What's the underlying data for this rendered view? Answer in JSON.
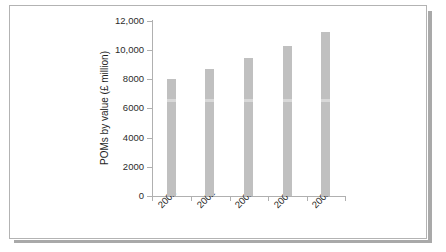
{
  "chart_data": {
    "type": "bar",
    "title": "",
    "subtitle": "",
    "xlabel": "",
    "ylabel": "POMs by value (£ million)",
    "categories": [
      "2001",
      "2002",
      "2003",
      "2004",
      "2005"
    ],
    "values": [
      8000,
      8700,
      9450,
      10300,
      11250
    ],
    "series": [
      {
        "name": "POMs by value",
        "values": [
          8000,
          8700,
          9450,
          10300,
          11250
        ]
      }
    ],
    "ylim": [
      0,
      12000
    ],
    "yticks": [
      0,
      2000,
      4000,
      6000,
      8000,
      10000,
      12000
    ],
    "ytick_labels": [
      "0",
      "2000",
      "4000",
      "6000",
      "8000",
      "10,000",
      "12,000"
    ],
    "xtick_labels": [
      "2001",
      "2002",
      "2003",
      "2004",
      "2005"
    ],
    "xtick_rotation": -45,
    "grid": false,
    "legend": null,
    "legend_position": "none",
    "bar_color": "#c0c0c0",
    "axis_color": "#b0b0b0",
    "text_color": "#2b2b2b",
    "background_color": "#ffffff",
    "annotations": []
  },
  "figure": {
    "card_background": "#ffffff",
    "card_border_color": "#b3b3b3",
    "shadow_color": "#a9a9a9"
  }
}
